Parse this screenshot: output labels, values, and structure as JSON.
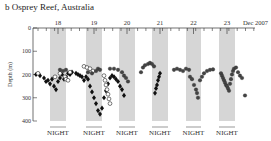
{
  "panel": {
    "label": "b",
    "title": "b  Osprey Reef, Australia"
  },
  "chart_data": {
    "type": "scatter",
    "title": "Osprey Reef, Australia",
    "xlabel": "Dec 2007",
    "ylabel": "Depth (m)",
    "ylim": [
      0,
      400
    ],
    "y_ticks": [
      0,
      100,
      200,
      300,
      400
    ],
    "y_inverted": true,
    "x_day_labels": [
      "18",
      "19",
      "20",
      "21",
      "22",
      "23"
    ],
    "x_end_label": "Dec 2007",
    "night_label": "NIGHT",
    "night_bands": [
      {
        "day": "18",
        "x0": 50,
        "x1": 66
      },
      {
        "day": "19",
        "x0": 86,
        "x1": 102
      },
      {
        "day": "20",
        "x0": 119,
        "x1": 135
      },
      {
        "day": "21",
        "x0": 152,
        "x1": 168
      },
      {
        "day": "22",
        "x0": 186,
        "x1": 201
      },
      {
        "day": "23",
        "x0": 219,
        "x1": 235
      }
    ],
    "grid": false,
    "legend": "none",
    "series": [
      {
        "name": "shark A (filled diamonds)",
        "marker": "diamond-filled",
        "points": [
          [
            36,
            200
          ],
          [
            40,
            205
          ],
          [
            44,
            215
          ],
          [
            46,
            230
          ],
          [
            48,
            225
          ],
          [
            50,
            240
          ],
          [
            52,
            220
          ],
          [
            54,
            250
          ],
          [
            56,
            265
          ],
          [
            58,
            230
          ],
          [
            60,
            215
          ],
          [
            62,
            200
          ],
          [
            64,
            220
          ],
          [
            66,
            210
          ],
          [
            68,
            195
          ],
          [
            70,
            200
          ],
          [
            72,
            190
          ],
          [
            76,
            195
          ],
          [
            78,
            200
          ],
          [
            80,
            205
          ],
          [
            82,
            210
          ],
          [
            84,
            225
          ],
          [
            86,
            210
          ],
          [
            88,
            220
          ],
          [
            90,
            250
          ],
          [
            92,
            275
          ],
          [
            94,
            300
          ],
          [
            96,
            325
          ],
          [
            98,
            355
          ],
          [
            100,
            370
          ],
          [
            102,
            345
          ],
          [
            104,
            300
          ],
          [
            106,
            270
          ],
          [
            108,
            240
          ],
          [
            110,
            215
          ],
          [
            112,
            205
          ],
          [
            114,
            210
          ],
          [
            116,
            220
          ],
          [
            118,
            230
          ],
          [
            120,
            250
          ],
          [
            122,
            265
          ],
          [
            124,
            290
          ],
          [
            155,
            280
          ],
          [
            156,
            260
          ],
          [
            157,
            245
          ],
          [
            158,
            225
          ],
          [
            159,
            210
          ],
          [
            160,
            195
          ]
        ]
      },
      {
        "name": "shark B (open circles)",
        "marker": "circle-open",
        "points": [
          [
            38,
            195
          ],
          [
            55,
            210
          ],
          [
            60,
            195
          ],
          [
            65,
            210
          ],
          [
            66,
            220
          ],
          [
            68,
            225
          ],
          [
            70,
            190
          ],
          [
            84,
            165
          ],
          [
            87,
            170
          ],
          [
            90,
            175
          ],
          [
            93,
            185
          ],
          [
            104,
            205
          ],
          [
            105,
            225
          ],
          [
            106,
            245
          ],
          [
            107,
            265
          ],
          [
            108,
            285
          ],
          [
            109,
            305
          ],
          [
            110,
            325
          ]
        ]
      },
      {
        "name": "shark C (filled circles)",
        "marker": "circle-filled",
        "points": [
          [
            60,
            180
          ],
          [
            63,
            185
          ],
          [
            66,
            180
          ],
          [
            88,
            190
          ],
          [
            92,
            195
          ],
          [
            96,
            185
          ],
          [
            98,
            175
          ],
          [
            100,
            180
          ],
          [
            110,
            175
          ],
          [
            114,
            175
          ],
          [
            118,
            180
          ],
          [
            122,
            190
          ],
          [
            124,
            205
          ],
          [
            126,
            215
          ],
          [
            128,
            230
          ],
          [
            141,
            190
          ],
          [
            143,
            170
          ],
          [
            145,
            160
          ],
          [
            148,
            155
          ],
          [
            150,
            150
          ],
          [
            152,
            155
          ],
          [
            154,
            165
          ],
          [
            174,
            180
          ],
          [
            177,
            175
          ],
          [
            180,
            180
          ],
          [
            183,
            185
          ],
          [
            186,
            175
          ],
          [
            189,
            180
          ],
          [
            190,
            210
          ],
          [
            192,
            220
          ],
          [
            194,
            245
          ],
          [
            196,
            265
          ],
          [
            197,
            280
          ],
          [
            198,
            300
          ],
          [
            200,
            225
          ],
          [
            202,
            210
          ],
          [
            204,
            195
          ],
          [
            207,
            185
          ],
          [
            210,
            180
          ],
          [
            213,
            178
          ],
          [
            221,
            195
          ],
          [
            222,
            205
          ],
          [
            223,
            215
          ],
          [
            224,
            225
          ],
          [
            225,
            235
          ],
          [
            226,
            245
          ],
          [
            227,
            250
          ],
          [
            228,
            260
          ],
          [
            229,
            270
          ],
          [
            230,
            240
          ],
          [
            231,
            220
          ],
          [
            232,
            200
          ],
          [
            233,
            185
          ],
          [
            234,
            175
          ],
          [
            236,
            170
          ],
          [
            238,
            190
          ],
          [
            240,
            205
          ],
          [
            242,
            215
          ],
          [
            245,
            290
          ]
        ]
      }
    ]
  }
}
